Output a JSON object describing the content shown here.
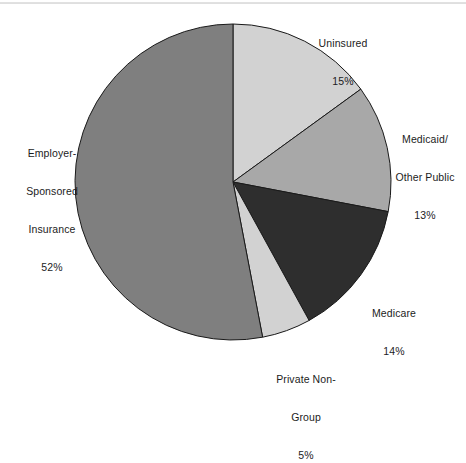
{
  "chart_data": {
    "type": "pie",
    "title": "",
    "subtitle": "",
    "xlabel": "",
    "ylabel": "",
    "legend_position": "none",
    "grid": false,
    "units": "percent",
    "start_angle_deg": 0,
    "direction": "clockwise",
    "categories": [
      "Uninsured",
      "Medicaid/Other Public",
      "Medicare",
      "Private Non-Group",
      "Employer-Sponsored Insurance"
    ],
    "values": [
      15,
      13,
      14,
      5,
      52
    ],
    "colors": [
      "#d2d2d2",
      "#a8a8a8",
      "#2e2e2e",
      "#d2d2d2",
      "#7f7f7f"
    ],
    "slices": [
      {
        "name": "Uninsured",
        "value": 15,
        "value_label": "15%",
        "color": "#d2d2d2",
        "start_deg": 0,
        "end_deg": 54
      },
      {
        "name": "Medicaid/Other Public",
        "value": 13,
        "value_label": "13%",
        "color": "#a8a8a8",
        "start_deg": 54,
        "end_deg": 100.8
      },
      {
        "name": "Medicare",
        "value": 14,
        "value_label": "14%",
        "color": "#2e2e2e",
        "start_deg": 100.8,
        "end_deg": 151.2
      },
      {
        "name": "Private Non-Group",
        "value": 5,
        "value_label": "5%",
        "color": "#d2d2d2",
        "start_deg": 151.2,
        "end_deg": 169.2
      },
      {
        "name": "Employer-Sponsored Insurance",
        "value": 52,
        "value_label": "52%",
        "color": "#7f7f7f",
        "start_deg": 169.2,
        "end_deg": 360
      }
    ],
    "geometry": {
      "center_x": 233,
      "center_y": 182,
      "radius": 158,
      "stroke": "#1a1a1a",
      "stroke_width": 1
    }
  },
  "labels": {
    "uninsured": {
      "line1": "Uninsured",
      "line2": "15%"
    },
    "medicaid": {
      "line1": "Medicaid/",
      "line2": "Other Public",
      "line3": "13%"
    },
    "medicare": {
      "line1": "Medicare",
      "line2": "14%"
    },
    "private_non_group": {
      "line1": "Private Non-",
      "line2": "Group",
      "line3": "5%"
    },
    "employer": {
      "line1": "Employer-",
      "line2": "Sponsored",
      "line3": "Insurance",
      "line4": "52%"
    }
  }
}
